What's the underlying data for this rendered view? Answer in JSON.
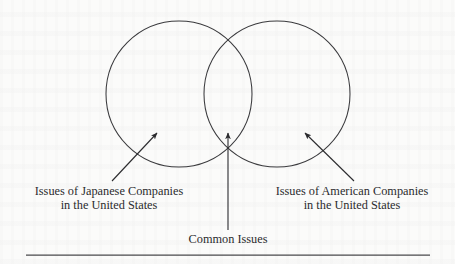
{
  "figure": {
    "type": "venn-diagram",
    "set_count": 2,
    "background_color": "#fbfbfa",
    "ink_color": "#2b2b2e",
    "labels": {
      "left": {
        "line1": "Issues of Japanese Companies",
        "line2": "in the United States"
      },
      "right": {
        "line1": "Issues of American Companies",
        "line2": "in the United States"
      },
      "center": {
        "line1": "Common Issues"
      }
    },
    "circles": [
      {
        "name": "left-circle",
        "cx": 179,
        "cy": 94,
        "r": 73
      },
      {
        "name": "right-circle",
        "cx": 277,
        "cy": 94,
        "r": 73
      }
    ],
    "arrows": [
      {
        "name": "left-arrow",
        "from_x": 112,
        "from_y": 181,
        "to_x": 157,
        "to_y": 133
      },
      {
        "name": "center-arrow",
        "from_x": 228,
        "from_y": 230,
        "to_x": 228,
        "to_y": 133
      },
      {
        "name": "right-arrow",
        "from_x": 354,
        "from_y": 181,
        "to_x": 305,
        "to_y": 133
      }
    ],
    "rule": {
      "name": "footer-rule",
      "x1": 26,
      "x2": 430,
      "y": 255
    }
  }
}
